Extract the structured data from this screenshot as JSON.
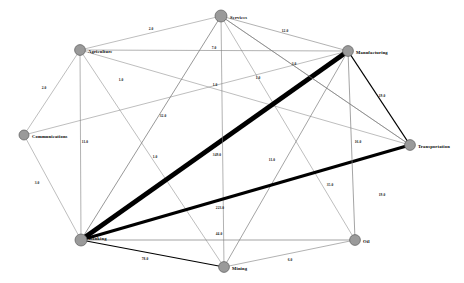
{
  "chart_data": {
    "type": "diagram",
    "graph_type": "undirected-weighted-network",
    "title": "",
    "nodes": [
      {
        "id": "services",
        "label": "Services",
        "x": 221,
        "y": 16,
        "r": 6.0,
        "label_dx": 9,
        "label_dy": 1.5,
        "anchor": "start"
      },
      {
        "id": "agriculture",
        "label": "Agriculture",
        "x": 80,
        "y": 50,
        "r": 5.4,
        "label_dx": 8,
        "label_dy": 1.5,
        "anchor": "start"
      },
      {
        "id": "manufacturing",
        "label": "Manufacturing",
        "x": 348,
        "y": 51,
        "r": 5.4,
        "label_dx": 8,
        "label_dy": 1.5,
        "anchor": "start"
      },
      {
        "id": "communications",
        "label": "Communications",
        "x": 24,
        "y": 135,
        "r": 5.0,
        "label_dx": 8,
        "label_dy": 1.5,
        "anchor": "start"
      },
      {
        "id": "transportation",
        "label": "Transportation",
        "x": 410,
        "y": 145,
        "r": 5.4,
        "label_dx": 8,
        "label_dy": 1.5,
        "anchor": "start"
      },
      {
        "id": "banking",
        "label": "Banking",
        "x": 81,
        "y": 240,
        "r": 6.0,
        "label_dx": 8,
        "label_dy": -1,
        "anchor": "start"
      },
      {
        "id": "mining",
        "label": "Mining",
        "x": 224,
        "y": 267,
        "r": 5.4,
        "label_dx": 8,
        "label_dy": 1.5,
        "anchor": "start"
      },
      {
        "id": "oil",
        "label": "Oil",
        "x": 355,
        "y": 240,
        "r": 5.4,
        "label_dx": 8,
        "label_dy": 1.5,
        "anchor": "start"
      }
    ],
    "edges": [
      {
        "source": "agriculture",
        "target": "services",
        "weight": 2.0,
        "label": "2.0",
        "width": 0.5,
        "heavy": false,
        "lx": 151,
        "ly": 30
      },
      {
        "source": "services",
        "target": "manufacturing",
        "weight": 12.0,
        "label": "12.0",
        "width": 0.6,
        "heavy": false,
        "lx": 285,
        "ly": 32
      },
      {
        "source": "agriculture",
        "target": "manufacturing",
        "weight": 7.0,
        "label": "7.0",
        "width": 0.6,
        "heavy": false,
        "lx": 214,
        "ly": 49
      },
      {
        "source": "services",
        "target": "transportation",
        "weight": 3.0,
        "label": "3.0",
        "width": 0.5,
        "heavy": false,
        "lx": 294,
        "ly": 65
      },
      {
        "source": "agriculture",
        "target": "communications",
        "weight": 2.0,
        "label": "2.0",
        "width": 0.5,
        "heavy": false,
        "lx": 44,
        "ly": 89
      },
      {
        "source": "agriculture",
        "target": "transportation",
        "weight": 1.0,
        "label": "1.0",
        "width": 0.5,
        "heavy": false,
        "lx": 121,
        "ly": 81
      },
      {
        "source": "services",
        "target": "oil",
        "weight": 1.0,
        "label": "1.0",
        "width": 0.5,
        "heavy": false,
        "lx": 215,
        "ly": 86
      },
      {
        "source": "communications",
        "target": "manufacturing",
        "weight": 1.0,
        "label": "1.0",
        "width": 0.5,
        "heavy": false,
        "lx": 258,
        "ly": 79
      },
      {
        "source": "manufacturing",
        "target": "transportation",
        "weight": 19.0,
        "label": "19.0",
        "width": 1.3,
        "heavy": true,
        "lx": 382,
        "ly": 97
      },
      {
        "source": "services",
        "target": "banking",
        "weight": 32.0,
        "label": "32.0",
        "width": 0.8,
        "heavy": false,
        "lx": 163,
        "ly": 117
      },
      {
        "source": "agriculture",
        "target": "banking",
        "weight": 11.0,
        "label": "11.0",
        "width": 0.6,
        "heavy": false,
        "lx": 85,
        "ly": 143
      },
      {
        "source": "agriculture",
        "target": "mining",
        "weight": 1.0,
        "label": "1.0",
        "width": 0.5,
        "heavy": false,
        "lx": 155,
        "ly": 158
      },
      {
        "source": "banking",
        "target": "manufacturing",
        "weight": 349.0,
        "label": "349.0",
        "width": 4.6,
        "heavy": true,
        "lx": 217,
        "ly": 156
      },
      {
        "source": "services",
        "target": "transportation",
        "weight": 16.0,
        "label": "16.0",
        "width": 0.7,
        "heavy": false,
        "lx": 358,
        "ly": 143
      },
      {
        "source": "communications",
        "target": "banking",
        "weight": 3.0,
        "label": "3.0",
        "width": 0.5,
        "heavy": false,
        "lx": 37,
        "ly": 184
      },
      {
        "source": "services",
        "target": "mining",
        "weight": 11.0,
        "label": "11.0",
        "width": 0.6,
        "heavy": false,
        "lx": 272,
        "ly": 161
      },
      {
        "source": "manufacturing",
        "target": "mining",
        "weight": 35.0,
        "label": "35.0",
        "width": 0.7,
        "heavy": false,
        "lx": 330,
        "ly": 186
      },
      {
        "source": "banking",
        "target": "transportation",
        "weight": 223.0,
        "label": "223.0",
        "width": 3.2,
        "heavy": true,
        "lx": 220,
        "ly": 209
      },
      {
        "source": "manufacturing",
        "target": "oil",
        "weight": 19.0,
        "label": "19.0",
        "width": 0.7,
        "heavy": false,
        "lx": 382,
        "ly": 196
      },
      {
        "source": "banking",
        "target": "oil",
        "weight": 44.0,
        "label": "44.0",
        "width": 0.7,
        "heavy": false,
        "lx": 219,
        "ly": 235
      },
      {
        "source": "banking",
        "target": "mining",
        "weight": 78.0,
        "label": "78.0",
        "width": 1.1,
        "heavy": true,
        "lx": 145,
        "ly": 260
      },
      {
        "source": "mining",
        "target": "oil",
        "weight": 6.0,
        "label": "6.0",
        "width": 0.6,
        "heavy": false,
        "lx": 290,
        "ly": 261
      }
    ],
    "colors": {
      "node_fill": "#9a9a9a",
      "node_stroke": "#5c5c5c",
      "edge_light": "#7d7d7d",
      "edge_heavy": "#000000",
      "background": "#ffffff",
      "label_text": "#050505"
    },
    "legend": null,
    "xlabel": "",
    "ylabel": "",
    "grid": false
  }
}
